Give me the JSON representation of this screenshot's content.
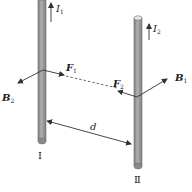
{
  "diagram": {
    "type": "physics-parallel-currents",
    "rods": [
      {
        "id": "I",
        "label": "Ⅰ",
        "current_label": "I",
        "current_sub": "1"
      },
      {
        "id": "II",
        "label": "Ⅱ",
        "current_label": "I",
        "current_sub": "2"
      }
    ],
    "vectors": {
      "F1": {
        "label": "F",
        "sub": "1"
      },
      "F2": {
        "label": "F",
        "sub": "2"
      },
      "B1": {
        "label": "B",
        "sub": "1"
      },
      "B2": {
        "label": "B",
        "sub": "2"
      }
    },
    "distance_label": "d",
    "colors": {
      "rod_fill": "#9a9a9a",
      "rod_edge": "#6e6e6e",
      "line": "#333333",
      "background": "#ffffff"
    }
  }
}
